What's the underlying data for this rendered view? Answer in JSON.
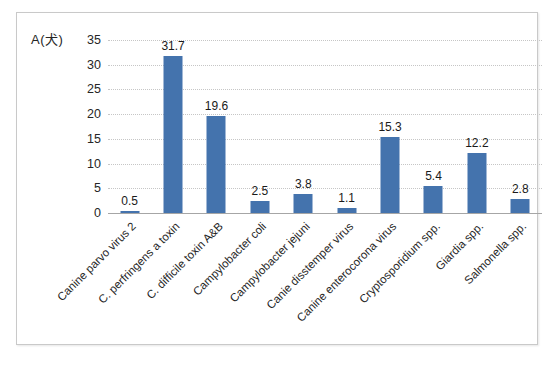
{
  "chart": {
    "title": "A(犬)",
    "bar_color": "#4473ad",
    "gridline_color": "#c6c6c6",
    "axis_color": "#a6a6a6",
    "frame_border_color": "#c9c9c9"
  },
  "chart_data": {
    "type": "bar",
    "title": "A(犬)",
    "xlabel": "",
    "ylabel": "",
    "ylim": [
      0,
      35
    ],
    "yticks": [
      0,
      5,
      10,
      15,
      20,
      25,
      30,
      35
    ],
    "grid": true,
    "legend": false,
    "data_labels": true,
    "categories": [
      "Canine parvo virus 2",
      "C. perfringens a toxin",
      "C. difficile toxin A&B",
      "Campylobacter coli",
      "Campylobacter jejuni",
      "Canie disstemper virus",
      "Canine enterocorona virus",
      "Cryptosporidium spp.",
      "Giardia spp.",
      "Salmonella spp."
    ],
    "values": [
      0.5,
      31.7,
      19.6,
      2.5,
      3.8,
      1.1,
      15.3,
      5.4,
      12.2,
      2.8
    ],
    "value_labels": [
      "0.5",
      "31.7",
      "19.6",
      "2.5",
      "3.8",
      "1.1",
      "15.3",
      "5.4",
      "12.2",
      "2.8"
    ],
    "ytick_labels": [
      "0",
      "5",
      "10",
      "15",
      "20",
      "25",
      "30",
      "35"
    ]
  }
}
